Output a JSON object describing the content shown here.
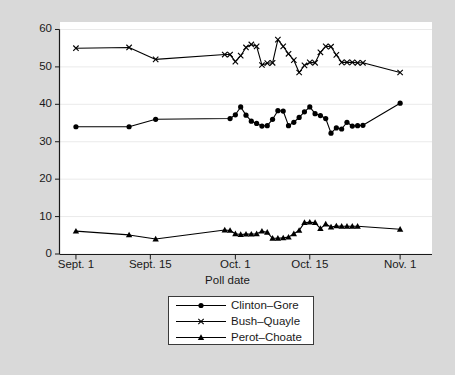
{
  "chart_data": {
    "type": "line",
    "title": "",
    "subtitle": "",
    "xlabel": "Poll date",
    "ylabel": "Percent support",
    "grid": true,
    "grid_axis": "y",
    "legend_position": "below-plot",
    "xlim": [
      0,
      70
    ],
    "ylim": [
      0,
      62
    ],
    "yticks": [
      0,
      10,
      20,
      30,
      40,
      50,
      60
    ],
    "ytick_labels": [
      "0",
      "10",
      "20",
      "30",
      "40",
      "50",
      "60"
    ],
    "xticks": [
      3,
      17,
      33,
      47,
      64
    ],
    "xtick_labels": [
      "Sept. 1",
      "Sept. 15",
      "Oct. 1",
      "Oct. 15",
      "Nov. 1"
    ],
    "series": [
      {
        "name": "Clinton–Gore",
        "marker": "filled-circle",
        "color": "#000000",
        "x": [
          3,
          13,
          18,
          32,
          33,
          34,
          35,
          36,
          37,
          38,
          39,
          40,
          41,
          42,
          43,
          44,
          45,
          46,
          47,
          48,
          49,
          50,
          51,
          52,
          53,
          54,
          55,
          56,
          57,
          64
        ],
        "y": [
          34.0,
          34.0,
          36.0,
          36.2,
          37.2,
          39.3,
          37.1,
          35.5,
          34.9,
          34.2,
          34.3,
          36.0,
          38.3,
          38.2,
          34.3,
          35.2,
          36.5,
          38.0,
          39.3,
          37.5,
          37.0,
          36.2,
          32.3,
          33.7,
          33.4,
          35.2,
          34.2,
          34.3,
          34.4,
          40.3
        ]
      },
      {
        "name": "Bush–Quayle",
        "marker": "cross",
        "color": "#000000",
        "x": [
          3,
          13,
          18,
          31,
          32,
          33,
          34,
          35,
          36,
          37,
          38,
          39,
          40,
          41,
          42,
          43,
          44,
          45,
          46,
          47,
          48,
          49,
          50,
          51,
          52,
          53,
          54,
          55,
          56,
          57,
          64
        ],
        "y": [
          55.0,
          55.2,
          52.0,
          53.3,
          53.3,
          51.4,
          53.0,
          55.2,
          56.0,
          55.5,
          50.5,
          51.0,
          51.1,
          57.3,
          55.5,
          53.5,
          51.8,
          48.5,
          50.4,
          51.2,
          51.1,
          53.9,
          55.5,
          55.4,
          53.2,
          51.2,
          51.2,
          51.2,
          51.1,
          51.1,
          48.5
        ]
      },
      {
        "name": "Perot–Choate",
        "marker": "filled-triangle",
        "color": "#000000",
        "x": [
          3,
          13,
          18,
          31,
          32,
          33,
          34,
          35,
          36,
          37,
          38,
          39,
          40,
          41,
          42,
          43,
          44,
          45,
          46,
          47,
          48,
          49,
          50,
          51,
          52,
          53,
          54,
          55,
          56,
          64
        ],
        "y": [
          6.1,
          5.1,
          4.0,
          6.4,
          6.3,
          5.4,
          5.2,
          5.3,
          5.3,
          5.4,
          6.1,
          5.8,
          4.2,
          4.2,
          4.3,
          4.5,
          5.4,
          6.3,
          8.4,
          8.5,
          8.4,
          6.8,
          8.0,
          7.2,
          7.5,
          7.4,
          7.4,
          7.4,
          7.4,
          6.6
        ]
      }
    ]
  },
  "legend": {
    "items": [
      {
        "label": "Clinton–Gore",
        "marker": "filled-circle"
      },
      {
        "label": "Bush–Quayle",
        "marker": "cross"
      },
      {
        "label": "Perot–Choate",
        "marker": "filled-triangle"
      }
    ]
  },
  "colors": {
    "figure_background": "#d9d9d9",
    "plot_background": "#ffffff",
    "gridline": "#eaeaea",
    "axis": "#1a1a1a",
    "series": "#000000",
    "legend_border": "#3a3a3a"
  }
}
